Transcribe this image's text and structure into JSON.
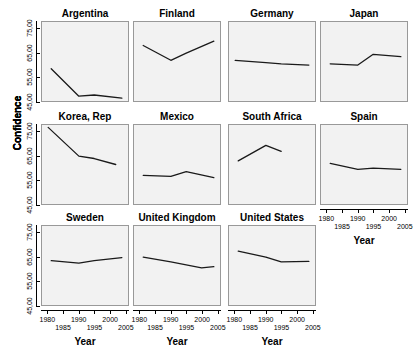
{
  "figure": {
    "y_axis_title": "Confidence",
    "x_axis_title": "Year",
    "y_tick_labels": [
      "45,00",
      "55,00",
      "65,00",
      "75,00"
    ],
    "x_tick_labels": [
      "1980",
      "1985",
      "1990",
      "1995",
      "2000",
      "2005"
    ],
    "line_color": "#1a1a1a",
    "panel_background": "#f2f2f2",
    "panel_border": "#999999"
  },
  "chart_data": {
    "type": "line",
    "title": "",
    "subtitle": "",
    "xlabel": "Year",
    "ylabel": "Confidence",
    "xlim": [
      1978,
      2006
    ],
    "ylim": [
      45,
      78
    ],
    "ytick_values": [
      45,
      55,
      65,
      75
    ],
    "ytick_labels": [
      "45,00",
      "55,00",
      "65,00",
      "75,00"
    ],
    "xtick_values": [
      1980,
      1985,
      1990,
      1995,
      2000,
      2005
    ],
    "xtick_labels": [
      "1980",
      "1985",
      "1990",
      "1995",
      "2000",
      "2005"
    ],
    "grid": false,
    "legend": "none",
    "layout": {
      "rows": 3,
      "cols": 4,
      "panel_order": [
        "Argentina",
        "Finland",
        "Germany",
        "Japan",
        "Korea, Rep",
        "Mexico",
        "South Africa",
        "Spain",
        "Sweden",
        "United Kingdom",
        "United States"
      ]
    },
    "panels": [
      {
        "name": "Argentina",
        "row": 0,
        "col": 0,
        "x": [
          1981,
          1990,
          1995,
          2004
        ],
        "y": [
          58.5,
          47.0,
          47.5,
          46.2
        ]
      },
      {
        "name": "Finland",
        "row": 0,
        "col": 1,
        "x": [
          1981,
          1990,
          1995,
          2004
        ],
        "y": [
          68.2,
          62.0,
          65.0,
          70.0
        ]
      },
      {
        "name": "Germany",
        "row": 0,
        "col": 2,
        "x": [
          1980,
          1990,
          1995,
          2004
        ],
        "y": [
          62.0,
          61.0,
          60.5,
          60.0
        ]
      },
      {
        "name": "Japan",
        "row": 0,
        "col": 3,
        "x": [
          1981,
          1990,
          1995,
          2004
        ],
        "y": [
          60.5,
          60.0,
          64.5,
          63.5
        ]
      },
      {
        "name": "Korea, Rep",
        "row": 1,
        "col": 0,
        "x": [
          1980,
          1990,
          1995,
          2002
        ],
        "y": [
          77.0,
          65.0,
          64.0,
          61.5
        ]
      },
      {
        "name": "Mexico",
        "row": 1,
        "col": 1,
        "x": [
          1981,
          1990,
          1995,
          2004
        ],
        "y": [
          57.0,
          56.5,
          58.5,
          56.0
        ]
      },
      {
        "name": "South Africa",
        "row": 1,
        "col": 2,
        "x": [
          1981,
          1990,
          1995
        ],
        "y": [
          63.0,
          69.5,
          67.0
        ]
      },
      {
        "name": "Spain",
        "row": 1,
        "col": 3,
        "x": [
          1981,
          1990,
          1995,
          2004
        ],
        "y": [
          62.0,
          59.5,
          60.0,
          59.5
        ]
      },
      {
        "name": "Sweden",
        "row": 2,
        "col": 0,
        "x": [
          1981,
          1990,
          1995,
          2004
        ],
        "y": [
          63.5,
          62.5,
          63.5,
          64.8
        ]
      },
      {
        "name": "United Kingdom",
        "row": 2,
        "col": 1,
        "x": [
          1981,
          1990,
          2000,
          2004
        ],
        "y": [
          65.0,
          63.0,
          60.5,
          61.0
        ]
      },
      {
        "name": "United States",
        "row": 2,
        "col": 2,
        "x": [
          1981,
          1990,
          1995,
          2004
        ],
        "y": [
          67.5,
          65.0,
          63.0,
          63.2
        ]
      }
    ]
  }
}
